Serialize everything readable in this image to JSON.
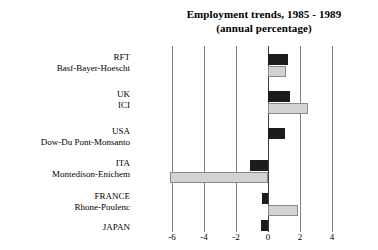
{
  "chart_data": {
    "type": "bar",
    "orientation": "horizontal",
    "title": "Employment trends, 1985 - 1989",
    "subtitle": "(annual percentage)",
    "xlabel": "",
    "ylabel": "",
    "xlim": [
      -6.5,
      4.2
    ],
    "xticks": [
      -6,
      -4,
      -2,
      0,
      2,
      4
    ],
    "xtick_labels": [
      "-6",
      "-4",
      "-2",
      "0",
      "2",
      "4"
    ],
    "grid": "vertical",
    "legend": "none",
    "categories": [
      {
        "line1": "RFT",
        "line2": "Basf-Bayer-Hoescht"
      },
      {
        "line1": "UK",
        "line2": "ICI"
      },
      {
        "line1": "USA",
        "line2": "Dow-Du Pont-Monsanto"
      },
      {
        "line1": "ITA",
        "line2": "Montedison-Enichem"
      },
      {
        "line1": "FRANCE",
        "line2": "Rhone-Poulenc"
      },
      {
        "line1": "JAPAN",
        "line2": ""
      }
    ],
    "series": [
      {
        "name": "country",
        "color": "#1c1c1c",
        "values": [
          1.25,
          1.35,
          1.05,
          -1.1,
          -0.4,
          -0.45
        ]
      },
      {
        "name": "company",
        "color": "#d2d2d2",
        "values": [
          1.1,
          2.5,
          null,
          -6.1,
          1.85,
          null
        ]
      }
    ]
  },
  "layout": {
    "plot_left_px": 136,
    "plot_top_px": 46,
    "plot_width_px": 242,
    "plot_height_px": 186,
    "zero_x_px": 132,
    "px_per_unit": 16,
    "bar_height_px": 11,
    "group_tops_px": [
      8,
      45,
      82,
      114,
      147,
      174
    ],
    "bar_row_offsets_px": [
      0,
      12
    ]
  }
}
